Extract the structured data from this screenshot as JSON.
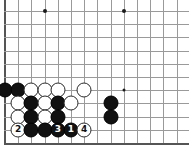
{
  "diagram": {
    "kind": "go-board-diagram",
    "board": {
      "line_color": "#9a9a9a",
      "edge_color": "#555555",
      "background": "#ffffff",
      "origin_x": 5,
      "origin_y": 11,
      "spacing": 13.2,
      "cols": 14,
      "rows": 11,
      "left_edge_x": 5,
      "bottom_edge_y": 143
    },
    "star_points": [
      {
        "name": "star-point-upper-left",
        "col": 3,
        "row": 0
      },
      {
        "name": "star-point-upper-right",
        "col": 9,
        "row": 0
      },
      {
        "name": "star-point-lower-right",
        "col": 9,
        "row": 6
      }
    ],
    "stones": [
      {
        "id": "s1",
        "color": "black",
        "label": "",
        "col": 0,
        "row": 6
      },
      {
        "id": "s2",
        "color": "black",
        "label": "",
        "col": 1,
        "row": 6
      },
      {
        "id": "s3",
        "color": "white",
        "label": "",
        "col": 2,
        "row": 6
      },
      {
        "id": "s4",
        "color": "white",
        "label": "",
        "col": 3,
        "row": 6
      },
      {
        "id": "s5",
        "color": "white",
        "label": "",
        "col": 4,
        "row": 6
      },
      {
        "id": "s6",
        "color": "white",
        "label": "",
        "col": 6,
        "row": 6
      },
      {
        "id": "s7",
        "color": "white",
        "label": "",
        "col": 1,
        "row": 7
      },
      {
        "id": "s8",
        "color": "black",
        "label": "",
        "col": 2,
        "row": 7
      },
      {
        "id": "s9",
        "color": "white",
        "label": "",
        "col": 3,
        "row": 7
      },
      {
        "id": "s10",
        "color": "black",
        "label": "",
        "col": 4,
        "row": 7
      },
      {
        "id": "s11",
        "color": "white",
        "label": "",
        "col": 5,
        "row": 7
      },
      {
        "id": "s12",
        "color": "black",
        "label": "",
        "col": 8,
        "row": 7
      },
      {
        "id": "s13",
        "color": "white",
        "label": "",
        "col": 1,
        "row": 8
      },
      {
        "id": "s14",
        "color": "black",
        "label": "",
        "col": 2,
        "row": 8
      },
      {
        "id": "s15",
        "color": "white",
        "label": "",
        "col": 3,
        "row": 8
      },
      {
        "id": "s16",
        "color": "black",
        "label": "",
        "col": 4,
        "row": 8
      },
      {
        "id": "s17",
        "color": "black",
        "label": "",
        "col": 8,
        "row": 8
      },
      {
        "id": "s18",
        "color": "white",
        "label": "2",
        "col": 1,
        "row": 9
      },
      {
        "id": "s19",
        "color": "black",
        "label": "",
        "col": 2,
        "row": 9
      },
      {
        "id": "s20",
        "color": "black",
        "label": "",
        "col": 3,
        "row": 9
      },
      {
        "id": "s21",
        "color": "black",
        "label": "3",
        "col": 4,
        "row": 9
      },
      {
        "id": "s22",
        "color": "black",
        "label": "1",
        "col": 5,
        "row": 9
      },
      {
        "id": "s23",
        "color": "white",
        "label": "4",
        "col": 6,
        "row": 9
      }
    ],
    "move_order": [
      "1",
      "2",
      "3",
      "4"
    ]
  }
}
